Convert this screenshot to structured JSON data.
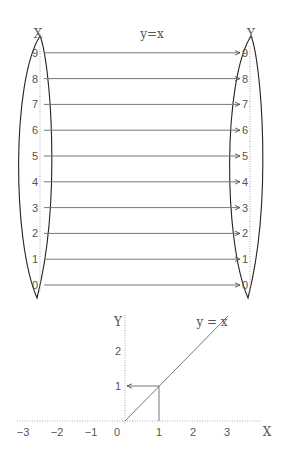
{
  "mapping_diagram": {
    "title": "y=x",
    "domain_label": "X",
    "codomain_label": "Y",
    "domain_values": [
      "9",
      "8",
      "7",
      "6",
      "5",
      "4",
      "3",
      "2",
      "1",
      "0"
    ],
    "codomain_values": [
      "9",
      "8",
      "7",
      "6",
      "5",
      "4",
      "3",
      "2",
      "1",
      "0"
    ],
    "mappings": [
      [
        9,
        9
      ],
      [
        8,
        8
      ],
      [
        7,
        7
      ],
      [
        6,
        6
      ],
      [
        5,
        5
      ],
      [
        4,
        4
      ],
      [
        3,
        3
      ],
      [
        2,
        2
      ],
      [
        1,
        1
      ],
      [
        0,
        0
      ]
    ]
  },
  "graph": {
    "function_label": "y = x",
    "x_axis_label": "X",
    "y_axis_label": "Y",
    "x_ticks": [
      "−3",
      "−2",
      "−1",
      "0",
      "1",
      "2",
      "3"
    ],
    "y_ticks": [
      "1",
      "2"
    ],
    "highlight_point": [
      1,
      1
    ]
  }
}
